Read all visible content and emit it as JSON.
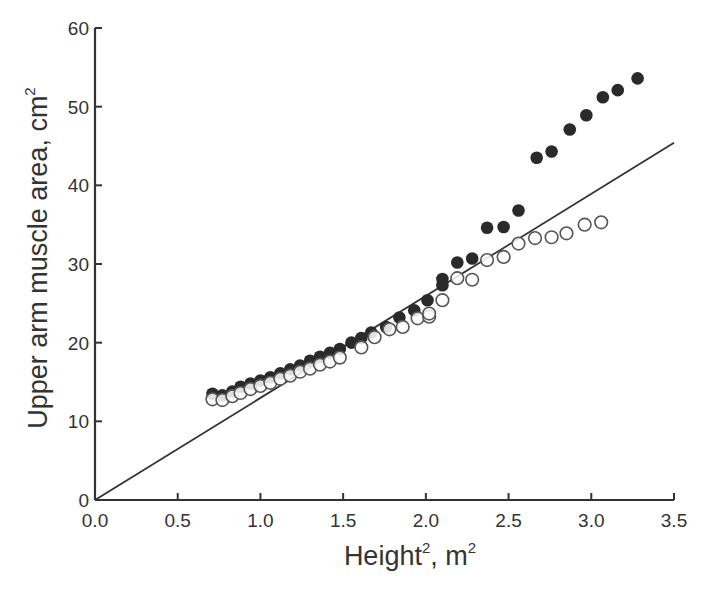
{
  "chart_data": {
    "type": "scatter",
    "title": "",
    "xlabel": "Height², m²",
    "ylabel": "Upper arm muscle area, cm²",
    "xlabel_parts": {
      "base": "Height",
      "sup1": "2",
      "unit": ", m",
      "sup2": "2"
    },
    "ylabel_parts": {
      "base": "Upper arm muscle area, cm",
      "sup": "2"
    },
    "xlim": [
      0.0,
      3.5
    ],
    "ylim": [
      0,
      60
    ],
    "xticks": [
      "0.0",
      "0.5",
      "1.0",
      "1.5",
      "2.0",
      "2.5",
      "3.0",
      "3.5"
    ],
    "yticks": [
      "0",
      "10",
      "20",
      "30",
      "40",
      "50",
      "60"
    ],
    "grid": false,
    "legend": null,
    "series": [
      {
        "name": "filled circles",
        "marker": "filled-circle",
        "color": "#2a2a2a",
        "points": [
          [
            0.71,
            13.5
          ],
          [
            0.77,
            13.3
          ],
          [
            0.83,
            13.8
          ],
          [
            0.88,
            14.4
          ],
          [
            0.94,
            14.8
          ],
          [
            1.0,
            15.2
          ],
          [
            1.06,
            15.6
          ],
          [
            1.12,
            16.1
          ],
          [
            1.18,
            16.6
          ],
          [
            1.24,
            17.1
          ],
          [
            1.3,
            17.7
          ],
          [
            1.36,
            18.2
          ],
          [
            1.42,
            18.7
          ],
          [
            1.48,
            19.2
          ],
          [
            1.55,
            20.0
          ],
          [
            1.61,
            20.6
          ],
          [
            1.67,
            21.3
          ],
          [
            1.76,
            22.0
          ],
          [
            1.84,
            23.2
          ],
          [
            1.93,
            24.1
          ],
          [
            2.01,
            25.4
          ],
          [
            2.1,
            27.3
          ],
          [
            2.1,
            28.1
          ],
          [
            2.19,
            30.2
          ],
          [
            2.28,
            30.7
          ],
          [
            2.37,
            34.6
          ],
          [
            2.47,
            34.7
          ],
          [
            2.56,
            36.8
          ],
          [
            2.67,
            43.5
          ],
          [
            2.76,
            44.3
          ],
          [
            2.87,
            47.1
          ],
          [
            2.97,
            48.9
          ],
          [
            3.07,
            51.2
          ],
          [
            3.16,
            52.1
          ],
          [
            3.28,
            53.6
          ]
        ]
      },
      {
        "name": "open circles",
        "marker": "open-circle",
        "color": "#555555",
        "points": [
          [
            0.71,
            12.8
          ],
          [
            0.77,
            12.7
          ],
          [
            0.83,
            13.2
          ],
          [
            0.88,
            13.6
          ],
          [
            0.94,
            14.1
          ],
          [
            1.0,
            14.5
          ],
          [
            1.06,
            14.9
          ],
          [
            1.12,
            15.4
          ],
          [
            1.18,
            15.8
          ],
          [
            1.24,
            16.3
          ],
          [
            1.3,
            16.7
          ],
          [
            1.36,
            17.2
          ],
          [
            1.42,
            17.6
          ],
          [
            1.48,
            18.1
          ],
          [
            1.61,
            19.4
          ],
          [
            1.69,
            20.7
          ],
          [
            1.78,
            21.7
          ],
          [
            1.86,
            22.0
          ],
          [
            1.95,
            23.1
          ],
          [
            2.02,
            23.3
          ],
          [
            2.02,
            23.7
          ],
          [
            2.1,
            25.4
          ],
          [
            2.19,
            28.2
          ],
          [
            2.28,
            28.0
          ],
          [
            2.37,
            30.5
          ],
          [
            2.47,
            30.9
          ],
          [
            2.56,
            32.6
          ],
          [
            2.66,
            33.3
          ],
          [
            2.76,
            33.4
          ],
          [
            2.85,
            33.9
          ],
          [
            2.96,
            35.0
          ],
          [
            3.06,
            35.3
          ]
        ]
      }
    ],
    "reference_line": {
      "name": "regression line",
      "from": [
        0.0,
        0.0
      ],
      "to": [
        3.5,
        45.4
      ],
      "color": "#333333"
    }
  }
}
